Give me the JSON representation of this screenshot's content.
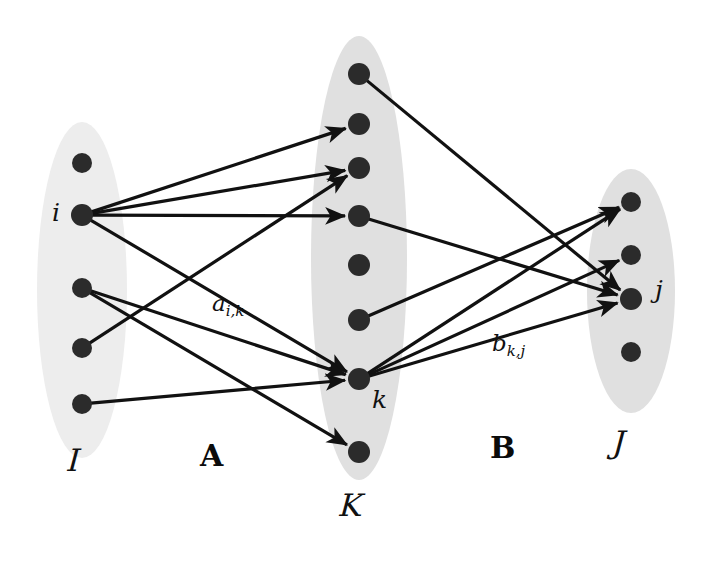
{
  "figure": {
    "type": "tripartite-bipartite-graph-diagram",
    "background_color": "#ffffff",
    "ellipse_fill": "#e3e3e3",
    "ellipse_fill_light": "#ededed",
    "node_color": "#2b2b2b",
    "edge_color": "#111111"
  },
  "sets": {
    "left": {
      "id": "I",
      "label": "ℐ",
      "label_plain": "I",
      "cx": 82,
      "cy": 290,
      "rx": 45,
      "ry": 168,
      "fill": "#ededed",
      "node_count": 5,
      "nodes": [
        {
          "id": "i1",
          "x": 82,
          "y": 163,
          "r": 10,
          "label": ""
        },
        {
          "id": "i",
          "x": 82,
          "y": 215,
          "r": 11,
          "label": "i"
        },
        {
          "id": "i3",
          "x": 82,
          "y": 288,
          "r": 10,
          "label": ""
        },
        {
          "id": "i4",
          "x": 82,
          "y": 348,
          "r": 10,
          "label": ""
        },
        {
          "id": "i5",
          "x": 82,
          "y": 404,
          "r": 10,
          "label": ""
        }
      ],
      "label_x": 68,
      "label_y": 442
    },
    "middle": {
      "id": "K",
      "label": "𝒦",
      "label_plain": "K",
      "cx": 359,
      "cy": 258,
      "rx": 48,
      "ry": 222,
      "fill": "#e0e0e0",
      "node_count": 8,
      "nodes": [
        {
          "id": "k1",
          "x": 359,
          "y": 74,
          "r": 11,
          "label": ""
        },
        {
          "id": "k2",
          "x": 359,
          "y": 124,
          "r": 11,
          "label": ""
        },
        {
          "id": "k3",
          "x": 359,
          "y": 168,
          "r": 11,
          "label": ""
        },
        {
          "id": "k4",
          "x": 359,
          "y": 216,
          "r": 11,
          "label": ""
        },
        {
          "id": "k5",
          "x": 359,
          "y": 265,
          "r": 11,
          "label": ""
        },
        {
          "id": "k6",
          "x": 359,
          "y": 320,
          "r": 11,
          "label": ""
        },
        {
          "id": "k",
          "x": 359,
          "y": 379,
          "r": 11,
          "label": "k"
        },
        {
          "id": "k8",
          "x": 359,
          "y": 452,
          "r": 11,
          "label": ""
        }
      ],
      "label_x": 340,
      "label_y": 487
    },
    "right": {
      "id": "J",
      "label": "𝒥",
      "label_plain": "J",
      "cx": 631,
      "cy": 291,
      "rx": 44,
      "ry": 122,
      "fill": "#e0e0e0",
      "node_count": 4,
      "nodes": [
        {
          "id": "j1",
          "x": 631,
          "y": 202,
          "r": 10,
          "label": ""
        },
        {
          "id": "j2",
          "x": 631,
          "y": 255,
          "r": 10,
          "label": ""
        },
        {
          "id": "j",
          "x": 631,
          "y": 299,
          "r": 11,
          "label": "j"
        },
        {
          "id": "j4",
          "x": 631,
          "y": 352,
          "r": 10,
          "label": ""
        }
      ],
      "label_x": 613,
      "label_y": 424
    }
  },
  "matrices": [
    {
      "id": "A",
      "label": "A",
      "x": 200,
      "y": 438,
      "between": "I-K"
    },
    {
      "id": "B",
      "label": "B",
      "x": 490,
      "y": 430,
      "between": "K-J"
    }
  ],
  "node_labels": [
    {
      "for": "i",
      "text": "i",
      "x": 52,
      "y": 198
    },
    {
      "for": "k",
      "text": "k",
      "x": 372,
      "y": 385
    },
    {
      "for": "j",
      "text": "j",
      "x": 655,
      "y": 275
    }
  ],
  "edge_labels": [
    {
      "id": "a_ik",
      "base": "a",
      "sub": "i,k",
      "x": 212,
      "y": 290,
      "describes": "A"
    },
    {
      "id": "b_kj",
      "base": "b",
      "sub": "k,j",
      "x": 492,
      "y": 330,
      "describes": "B"
    }
  ],
  "edges": {
    "A": [
      {
        "from": "i",
        "to": "k2",
        "arrow": true
      },
      {
        "from": "i",
        "to": "k3",
        "arrow": true
      },
      {
        "from": "i",
        "to": "k4",
        "arrow": true
      },
      {
        "from": "i",
        "to": "k",
        "arrow": true
      },
      {
        "from": "i3",
        "to": "k",
        "arrow": true
      },
      {
        "from": "i4",
        "to": "k3",
        "arrow": true
      },
      {
        "from": "i5",
        "to": "k",
        "arrow": true
      },
      {
        "from": "i3",
        "to": "k8",
        "arrow": true
      }
    ],
    "B": [
      {
        "from": "k1",
        "to": "j",
        "arrow": true
      },
      {
        "from": "k4",
        "to": "j",
        "arrow": true
      },
      {
        "from": "k6",
        "to": "j1",
        "arrow": true
      },
      {
        "from": "k",
        "to": "j1",
        "arrow": true
      },
      {
        "from": "k",
        "to": "j2",
        "arrow": true
      },
      {
        "from": "k",
        "to": "j",
        "arrow": true
      }
    ]
  }
}
